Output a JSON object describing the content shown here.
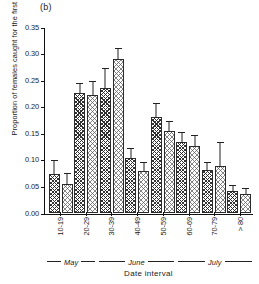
{
  "panel": {
    "label": "(b)"
  },
  "chart_data": {
    "type": "bar",
    "title": "",
    "panel_label": "(b)",
    "xlabel": "Date interval",
    "ylabel": "Proportion of females caught for the first time",
    "ylim": [
      0.0,
      0.35
    ],
    "yticks": [
      "0.00",
      "0.05",
      "0.10",
      "0.15",
      "0.20",
      "0.25",
      "0.30",
      "0.35"
    ],
    "ytick_values": [
      0.0,
      0.05,
      0.1,
      0.15,
      0.2,
      0.25,
      0.3,
      0.35
    ],
    "grid": false,
    "legend": "none",
    "categories": [
      "10-19",
      "20-29",
      "30-39",
      "40-49",
      "50-59",
      "60-69",
      "70-79",
      "> 80"
    ],
    "series": [
      {
        "name": "series-1",
        "pattern": "dense-crosshatch",
        "values": [
          0.073,
          0.225,
          0.236,
          0.104,
          0.181,
          0.134,
          0.081,
          0.041
        ],
        "errors": [
          0.028,
          0.022,
          0.039,
          0.021,
          0.028,
          0.021,
          0.016,
          0.013
        ]
      },
      {
        "name": "series-2",
        "pattern": "light-stipple",
        "values": [
          0.055,
          0.222,
          0.29,
          0.079,
          0.155,
          0.127,
          0.088,
          0.036
        ],
        "errors": [
          0.022,
          0.028,
          0.022,
          0.018,
          0.02,
          0.022,
          0.048,
          0.013
        ]
      }
    ],
    "month_brackets": [
      {
        "name": "May",
        "from": "10-19",
        "to": "20-29",
        "span": 2
      },
      {
        "name": "June",
        "from": "30-39",
        "to": "50-59",
        "span": 3
      },
      {
        "name": "July",
        "from": "60-69",
        "to": "> 80",
        "span": 3
      }
    ]
  }
}
